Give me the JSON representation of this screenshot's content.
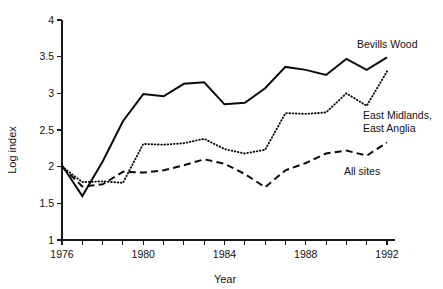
{
  "chart_data": {
    "type": "line",
    "title": "",
    "xlabel": "Year",
    "ylabel": "Log index",
    "xlim": [
      1976,
      1992
    ],
    "ylim": [
      1,
      4
    ],
    "grid": false,
    "legend_position": "inline-right",
    "x": [
      1976,
      1977,
      1978,
      1979,
      1980,
      1981,
      1982,
      1983,
      1984,
      1985,
      1986,
      1987,
      1988,
      1989,
      1990,
      1991,
      1992
    ],
    "xticks": [
      1976,
      1977,
      1978,
      1979,
      1980,
      1981,
      1982,
      1983,
      1984,
      1985,
      1986,
      1987,
      1988,
      1989,
      1990,
      1991,
      1992
    ],
    "xtick_labels": [
      "1976",
      "",
      "",
      "",
      "1980",
      "",
      "",
      "",
      "1984",
      "",
      "",
      "",
      "1988",
      "",
      "",
      "",
      "1992"
    ],
    "yticks": [
      1,
      1.5,
      2,
      2.5,
      3,
      3.5,
      4
    ],
    "ytick_labels": [
      "1",
      "1.5",
      "2",
      "2.5",
      "3",
      "3.5",
      "4"
    ],
    "series": [
      {
        "name": "Bevills Wood",
        "style": "solid",
        "color": "#0b0b0b",
        "values": [
          2.02,
          1.6,
          2.07,
          2.62,
          2.99,
          2.96,
          3.13,
          3.15,
          2.85,
          2.87,
          3.07,
          3.36,
          3.32,
          3.25,
          3.47,
          3.32,
          3.49
        ],
        "label_x": 1992.4,
        "label_y": 3.62
      },
      {
        "name": "East Midlands, East Anglia",
        "style": "dotted",
        "color": "#0b0b0b",
        "values": [
          2.0,
          1.79,
          1.8,
          1.78,
          2.31,
          2.3,
          2.32,
          2.38,
          2.24,
          2.18,
          2.23,
          2.73,
          2.72,
          2.74,
          3.0,
          2.83,
          3.3
        ],
        "label_x": 1992.4,
        "label_y": 2.95
      },
      {
        "name": "All sites",
        "style": "dashed",
        "color": "#0b0b0b",
        "values": [
          2.0,
          1.73,
          1.76,
          1.93,
          1.92,
          1.95,
          2.02,
          2.1,
          2.04,
          1.9,
          1.72,
          1.95,
          2.05,
          2.18,
          2.22,
          2.15,
          2.33
        ],
        "label_x": 1989.2,
        "label_y": 1.96
      }
    ],
    "series_labels": [
      "Bevills Wood",
      "East Midlands,",
      "East Anglia",
      "All sites"
    ]
  },
  "axes": {
    "y_title": "Log index",
    "x_title": "Year"
  },
  "labels": {
    "bevills_wood": "Bevills Wood",
    "east_midlands_line1": "East Midlands,",
    "east_midlands_line2": "East Anglia",
    "all_sites": "All sites"
  }
}
